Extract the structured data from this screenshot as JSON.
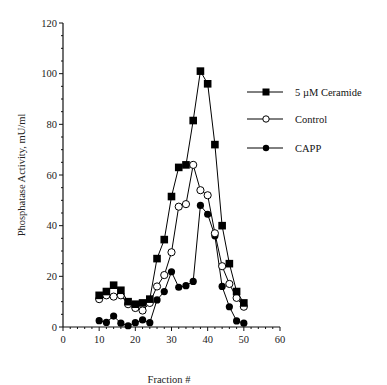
{
  "chart_data": {
    "type": "line",
    "title": "",
    "xlabel": "Fraction #",
    "ylabel": "Phosphatase Activity, mU/ml",
    "xlim": [
      0,
      60
    ],
    "ylim": [
      0,
      120
    ],
    "x_ticks": [
      0,
      10,
      20,
      30,
      40,
      50,
      60
    ],
    "y_ticks": [
      0,
      20,
      40,
      60,
      80,
      100,
      120
    ],
    "x_minor_step": 2,
    "y_minor_step": 5,
    "grid": false,
    "legend_position": "upper right",
    "x": [
      10,
      12,
      14,
      16,
      18,
      20,
      22,
      24,
      26,
      28,
      30,
      32,
      34,
      36,
      38,
      40,
      42,
      44,
      46,
      48,
      50
    ],
    "series": [
      {
        "name": "5 µM Ceramide",
        "marker": "filled-square",
        "values": [
          12.5,
          14,
          16.5,
          14.5,
          10,
          9,
          9.5,
          11,
          27,
          34.5,
          51.5,
          63,
          64,
          81.5,
          101,
          96,
          72,
          40,
          25,
          14,
          9.5
        ]
      },
      {
        "name": "Control",
        "marker": "open-circle",
        "values": [
          11,
          12.5,
          12,
          12.5,
          9,
          7.5,
          6.5,
          9.5,
          16,
          20.5,
          29.5,
          47.5,
          48.5,
          64,
          54,
          52,
          37,
          24,
          17,
          11.5,
          8
        ]
      },
      {
        "name": "CAPP",
        "marker": "filled-circle",
        "values": [
          2.5,
          1.8,
          4.3,
          1.5,
          0.5,
          1.7,
          2.8,
          1.7,
          10.7,
          14,
          21.8,
          15.7,
          16.3,
          18,
          48,
          44.5,
          36,
          16,
          8,
          2.4,
          1.5
        ]
      }
    ]
  }
}
